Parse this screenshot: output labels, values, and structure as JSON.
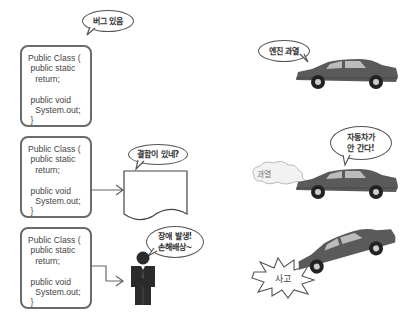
{
  "left_panel": {
    "code_boxes": [
      {
        "lines": [
          "Public Class (",
          " public static",
          "   return;",
          "",
          " public void",
          "   System.out;",
          " }"
        ]
      },
      {
        "lines": [
          "Public Class (",
          " public static",
          "   return;",
          "",
          " public void",
          "   System.out;",
          " }"
        ]
      },
      {
        "lines": [
          "Public Class (",
          " public static",
          "   return;",
          "",
          " public void",
          "   System.out;",
          " }"
        ]
      }
    ],
    "bubbles": {
      "bug": "버그 있음",
      "defect": "결함이 있네?",
      "failure_line1": "장애 발생!",
      "failure_line2": "손해배상~"
    },
    "icons": {
      "document": "document-icon",
      "person": "person-icon",
      "arrow": "arrow-icon"
    }
  },
  "right_panel": {
    "bubbles": {
      "engine": "엔진 과열",
      "car_stopped_line1": "자동차가",
      "car_stopped_line2": "안 간다!",
      "smoke": "과열",
      "accident": "사고"
    },
    "icons": {
      "car": "car-icon",
      "smoke_cloud": "smoke-cloud-icon",
      "crash_burst": "crash-burst-icon"
    }
  },
  "colors": {
    "box_border": "#6b6b6b",
    "car_body": "#5a5a5a",
    "person": "#2b2b2b"
  }
}
